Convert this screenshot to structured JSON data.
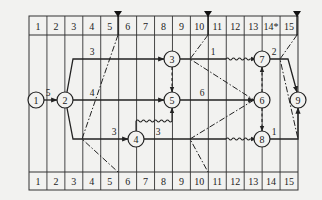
{
  "diagram": {
    "type": "time-scaled activity network",
    "grid": {
      "left": 29,
      "right": 298,
      "top_header_y": [
        16,
        35
      ],
      "body_y": [
        35,
        172
      ],
      "bottom_header_y": [
        172,
        190
      ],
      "columns": 15
    },
    "top_scale": [
      "1",
      "2",
      "3",
      "4",
      "5",
      "6",
      "7",
      "8",
      "9",
      "10",
      "11",
      "12",
      "13",
      "14*",
      "15"
    ],
    "bottom_scale": [
      "1",
      "2",
      "3",
      "4",
      "5",
      "6",
      "7",
      "8",
      "9",
      "10",
      "11",
      "12",
      "13",
      "14",
      "15"
    ],
    "markers": [
      {
        "name": "check-marker-5",
        "x": 118
      },
      {
        "name": "check-marker-10",
        "x": 208
      },
      {
        "name": "check-marker-15",
        "x": 297
      }
    ],
    "nodes": [
      {
        "id": "1",
        "x": 36,
        "y": 100
      },
      {
        "id": "2",
        "x": 65,
        "y": 100
      },
      {
        "id": "3",
        "x": 172,
        "y": 59
      },
      {
        "id": "4",
        "x": 136,
        "y": 139
      },
      {
        "id": "5",
        "x": 172,
        "y": 100
      },
      {
        "id": "6",
        "x": 262,
        "y": 100
      },
      {
        "id": "7",
        "x": 262,
        "y": 59
      },
      {
        "id": "8",
        "x": 262,
        "y": 139
      },
      {
        "id": "9",
        "x": 298,
        "y": 100
      }
    ],
    "activity_labels": [
      {
        "text": "5",
        "x": 48,
        "y": 96
      },
      {
        "text": "3",
        "x": 92,
        "y": 55
      },
      {
        "text": "4",
        "x": 92,
        "y": 96
      },
      {
        "text": "3",
        "x": 114,
        "y": 135
      },
      {
        "text": "3",
        "x": 158,
        "y": 135
      },
      {
        "text": "1",
        "x": 213,
        "y": 55
      },
      {
        "text": "6",
        "x": 202,
        "y": 96
      },
      {
        "text": "2",
        "x": 274,
        "y": 55
      },
      {
        "text": "1",
        "x": 274,
        "y": 135
      }
    ],
    "colors": {
      "line": "#222222",
      "background": "#f2f2f0",
      "grid": "#333333"
    }
  }
}
